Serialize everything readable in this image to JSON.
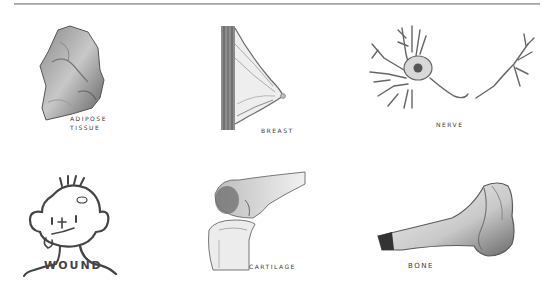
{
  "figure": {
    "top_rule": true,
    "panels": [
      {
        "id": "adipose-tissue",
        "label": "ADIPOSE\nTISSUE",
        "row": 1,
        "col": 1
      },
      {
        "id": "breast",
        "label": "BREAST",
        "row": 1,
        "col": 2
      },
      {
        "id": "nerve",
        "label": "NERVE",
        "row": 1,
        "col": 3
      },
      {
        "id": "wound",
        "label": "WOUND",
        "row": 2,
        "col": 1
      },
      {
        "id": "cartilage",
        "label": "CARTILAGE",
        "row": 2,
        "col": 2
      },
      {
        "id": "bone",
        "label": "BONE",
        "row": 2,
        "col": 3
      }
    ]
  },
  "colors": {
    "background": "#ffffff",
    "ink": "#3a3a3a",
    "shade_dark": "#555555",
    "shade_mid": "#9a9a9a",
    "shade_light": "#d6d6d6"
  }
}
